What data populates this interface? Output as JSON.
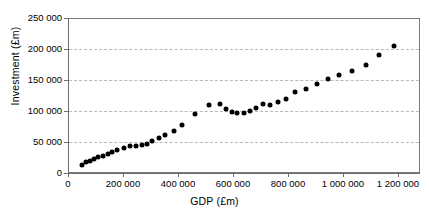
{
  "chart_data": {
    "type": "scatter",
    "title": "",
    "xlabel": "GDP (£m)",
    "ylabel": "Investment (£m)",
    "xlim": [
      0,
      1300000
    ],
    "ylim": [
      0,
      250000
    ],
    "xticks": [
      0,
      200000,
      400000,
      600000,
      800000,
      1000000,
      1200000
    ],
    "xticklabels": [
      "0",
      "200 000",
      "400 000",
      "600 000",
      "800 000",
      "1 000 000",
      "1 200 000"
    ],
    "yticks": [
      0,
      50000,
      100000,
      150000,
      200000,
      250000
    ],
    "yticklabels": [
      "0",
      "50 000",
      "100 000",
      "150 000",
      "200 000",
      "250 000"
    ],
    "grid": "horizontal-dashed",
    "legend": "none",
    "marker": "filled-diamond",
    "marker_color": "#000000",
    "series": [
      {
        "name": "GDP vs Investment",
        "x": [
          52000,
          66000,
          80000,
          96000,
          112000,
          128000,
          146000,
          163000,
          182000,
          205000,
          228000,
          252000,
          272000,
          292000,
          312000,
          335000,
          360000,
          390000,
          420000,
          470000,
          520000,
          560000,
          585000,
          605000,
          625000,
          650000,
          672000,
          695000,
          720000,
          745000,
          775000,
          805000,
          840000,
          880000,
          920000,
          960000,
          1000000,
          1050000,
          1100000,
          1150000,
          1205000
        ],
        "y": [
          13000,
          17000,
          20000,
          23000,
          26000,
          28000,
          31000,
          34000,
          37000,
          41000,
          43000,
          43000,
          45000,
          47000,
          52000,
          57000,
          62000,
          67000,
          77000,
          95000,
          110000,
          112000,
          103000,
          98000,
          97000,
          97000,
          100000,
          105000,
          112000,
          110000,
          115000,
          120000,
          130000,
          136000,
          144000,
          152000,
          158000,
          165000,
          175000,
          190000,
          205000
        ]
      }
    ]
  },
  "axis": {
    "x_title": "GDP (£m)",
    "y_title": "Investment (£m)"
  }
}
